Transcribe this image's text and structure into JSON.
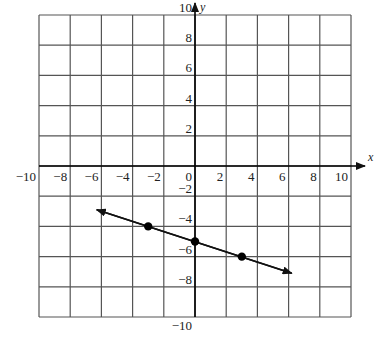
{
  "figure": {
    "type": "coordinate-plane-line-graph",
    "x_axis": {
      "label": "x",
      "min": -10,
      "max": 10,
      "tick_step": 2,
      "tick_labels": [
        "-10",
        "-8",
        "-6",
        "-4",
        "-2",
        "0",
        "2",
        "4",
        "6",
        "8",
        "10"
      ]
    },
    "y_axis": {
      "label": "y",
      "min": -10,
      "max": 10,
      "tick_step": 2,
      "tick_labels": [
        "10",
        "8",
        "6",
        "4",
        "2",
        "-2",
        "-4",
        "-6",
        "-8",
        "-10"
      ]
    },
    "grid": {
      "on": true,
      "cells_x": 10,
      "cells_y": 10
    },
    "line": {
      "equation": "y = -x/3 - 5",
      "slope": -0.3333,
      "y_intercept": -5,
      "arrows": "both",
      "start": [
        -6.3,
        -2.9
      ],
      "end": [
        6.2,
        -7.1
      ]
    },
    "points": [
      {
        "x": -3,
        "y": -4
      },
      {
        "x": 0,
        "y": -5
      },
      {
        "x": 3,
        "y": -6
      }
    ],
    "colors": {
      "grid": "#555555",
      "axes": "#000000",
      "line": "#111111",
      "points": "#000000",
      "background": "#ffffff"
    }
  }
}
